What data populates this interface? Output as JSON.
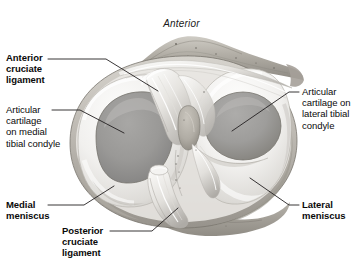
{
  "figure": {
    "title": "Anterior",
    "orientation_label": "Anterior"
  },
  "labels": [
    {
      "id": "anterior-cruciate-ligament",
      "text": "Anterior\ncruciate\nligament",
      "bold": true,
      "side": "left",
      "x": 6,
      "y": 52,
      "leader": {
        "from": [
          48,
          59
        ],
        "elbow": [
          106,
          59
        ],
        "to": [
          158,
          91
        ]
      }
    },
    {
      "id": "articular-cartilage-medial-tibial-condyle",
      "text": "Articular\ncartilage\non medial\ntibial condyle",
      "bold": false,
      "side": "left",
      "x": 6,
      "y": 104,
      "leader": {
        "from": [
          52,
          110
        ],
        "elbow": [
          80,
          110
        ],
        "to": [
          124,
          133
        ]
      }
    },
    {
      "id": "medial-meniscus",
      "text": "Medial\nmeniscus",
      "bold": true,
      "side": "left",
      "x": 6,
      "y": 199,
      "leader": {
        "from": [
          48,
          205
        ],
        "elbow": [
          84,
          205
        ],
        "to": [
          114,
          186
        ]
      }
    },
    {
      "id": "posterior-cruciate-ligament",
      "text": "Posterior\ncruciate\nligament",
      "bold": true,
      "side": "left",
      "x": 62,
      "y": 225,
      "leader": {
        "from": [
          110,
          231
        ],
        "elbow": [
          152,
          231
        ],
        "to": [
          178,
          208
        ]
      }
    },
    {
      "id": "articular-cartilage-lateral-tibial-condyle",
      "text": "Articular\ncartilage on\nlateral tibial\ncondyle",
      "bold": false,
      "side": "right",
      "x": 302,
      "y": 86,
      "leader": {
        "from": [
          299,
          92
        ],
        "elbow": [
          289,
          92
        ],
        "to": [
          232,
          131
        ]
      }
    },
    {
      "id": "lateral-meniscus",
      "text": "Lateral\nmeniscus",
      "bold": true,
      "side": "right",
      "x": 302,
      "y": 199,
      "leader": {
        "from": [
          299,
          205
        ],
        "elbow": [
          289,
          205
        ],
        "to": [
          250,
          178
        ]
      }
    }
  ],
  "colors": {
    "background": "#ffffff",
    "text": "#0a0a0a",
    "leader_line": "#231f20",
    "meniscus_light": "#f2f1ef",
    "meniscus_shadow": "#cdcbc8",
    "cartilage_medial": "#9c9b99",
    "cartilage_lateral": "#a3a2a0",
    "cartilage_dark_edge": "#7e7d7b",
    "bone_rim": "#b5b2ab",
    "bone_mottle": "#8e8a83",
    "ligament_light": "#f6f5f3",
    "ligament_mid": "#d8d6d2",
    "ligament_shadow": "#a9a6a1",
    "eminence": "#b0ada6",
    "outline": "#6d6b68"
  },
  "anatomy_parts": [
    "tibial plateau rim",
    "medial meniscus",
    "lateral meniscus",
    "articular cartilage on medial tibial condyle",
    "articular cartilage on lateral tibial condyle",
    "anterior cruciate ligament",
    "posterior cruciate ligament",
    "intercondylar eminence",
    "transverse ligament",
    "tibial tuberosity / anterior bony ridge"
  ]
}
